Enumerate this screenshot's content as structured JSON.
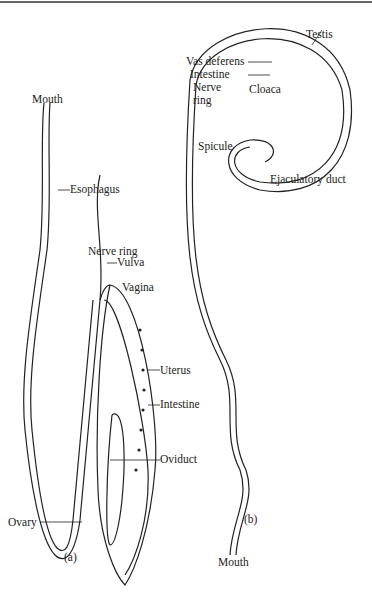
{
  "female": {
    "mouth": "Mouth",
    "esophagus": "Esophagus",
    "nerve_ring": "Nerve ring",
    "vulva": "Vulva",
    "vagina": "Vagina",
    "uterus": "Uterus",
    "intestine": "Intestine",
    "oviduct": "Oviduct",
    "ovary": "Ovary",
    "panel": "(a)"
  },
  "male": {
    "testis": "Testis",
    "vas_deferens": "Vas deferens",
    "intestine": "Intestine",
    "nerve_ring1": "Nerve",
    "nerve_ring2": "ring",
    "cloaca": "Cloaca",
    "spicule": "Spicule",
    "ejaculatory_duct": "Ejaculatory duct",
    "mouth": "Mouth",
    "panel": "(b)"
  }
}
